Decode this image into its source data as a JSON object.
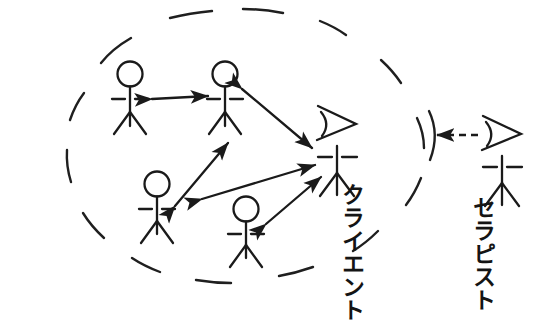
{
  "diagram": {
    "kind": "stick-figure-relationship-diagram",
    "background_color": "#ffffff",
    "stroke_color": "#1a1a1a",
    "labels": {
      "client": "クライエント",
      "therapist": "セラピスト"
    },
    "group_boundary": {
      "name": "dashed-ellipse-group-boundary",
      "style": "dashed",
      "shape": "ellipse"
    },
    "actors": [
      {
        "id": "member-top-left",
        "head": "circle",
        "position": "inside-group"
      },
      {
        "id": "member-top-center",
        "head": "circle",
        "position": "inside-group"
      },
      {
        "id": "member-lower-left",
        "head": "circle",
        "position": "inside-group"
      },
      {
        "id": "member-lower-center",
        "head": "circle",
        "position": "inside-group"
      },
      {
        "id": "client",
        "head": "profile-triangle",
        "position": "inside-group-right-edge"
      },
      {
        "id": "therapist",
        "head": "profile-triangle",
        "position": "outside-group"
      }
    ],
    "connections": [
      {
        "from": "member-top-left",
        "to": "member-top-center",
        "arrow": "double",
        "style": "solid"
      },
      {
        "from": "member-top-center",
        "to": "client",
        "arrow": "double",
        "style": "solid"
      },
      {
        "from": "member-lower-left",
        "to": "member-top-center",
        "arrow": "double",
        "style": "solid"
      },
      {
        "from": "member-lower-left",
        "to": "client",
        "arrow": "double",
        "style": "solid"
      },
      {
        "from": "member-lower-center",
        "to": "client",
        "arrow": "double",
        "style": "solid"
      },
      {
        "from": "therapist",
        "to": "group-boundary",
        "arrow": "single",
        "style": "dashed"
      }
    ]
  }
}
